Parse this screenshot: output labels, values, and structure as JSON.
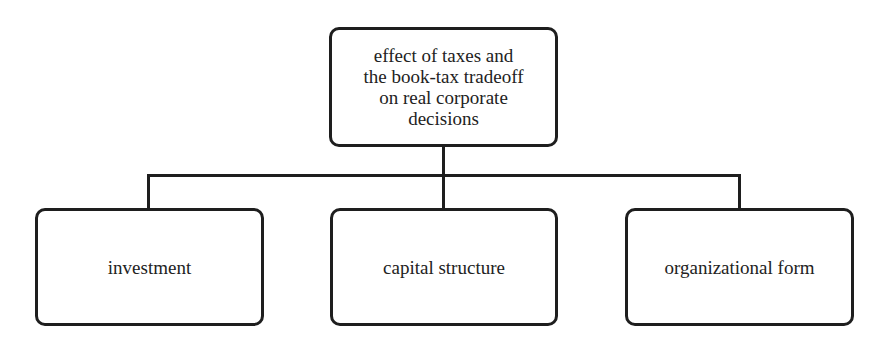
{
  "diagram": {
    "type": "hierarchy-tree",
    "root": {
      "label": "effect of taxes and the book-tax tradeoff on real corporate decisions",
      "lines": [
        "effect of taxes and",
        "the book-tax tradeoff",
        "on real corporate",
        "decisions"
      ]
    },
    "children": [
      {
        "label": "investment"
      },
      {
        "label": "capital structure"
      },
      {
        "label": "organizational form"
      }
    ],
    "colors": {
      "stroke": "#1e1e1e",
      "text": "#222222",
      "background": "#ffffff"
    }
  }
}
